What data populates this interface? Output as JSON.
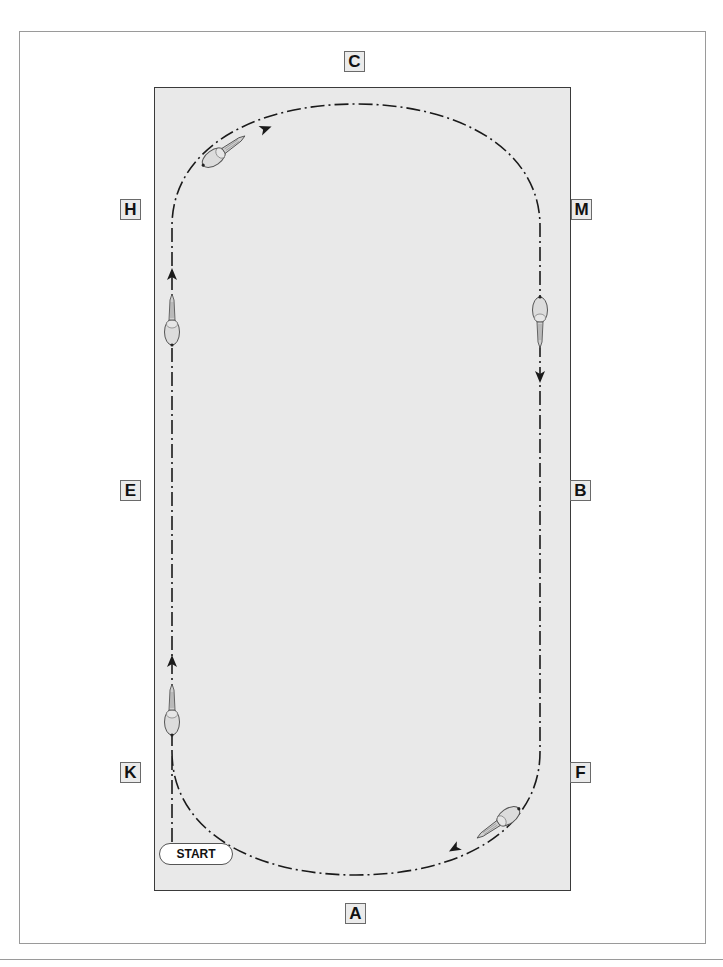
{
  "diagram": {
    "type": "arena-riding-pattern",
    "markers": {
      "C": "C",
      "H": "H",
      "M": "M",
      "E": "E",
      "B": "B",
      "K": "K",
      "F": "F",
      "A": "A"
    },
    "start_label": "START",
    "colors": {
      "arena_fill": "#e9e9e9",
      "arena_border": "#3a3a3a",
      "track_line": "#1a1a1a",
      "marker_fill": "#ebebeb"
    },
    "path": {
      "shape": "oval",
      "line_style": "dash-dot",
      "direction": "clockwise",
      "start_position": "bottom-left near K"
    },
    "riders": [
      {
        "position": "top-left arc near H",
        "heading": "up-right"
      },
      {
        "position": "left side between H and E",
        "heading": "up"
      },
      {
        "position": "right side between M and B",
        "heading": "down"
      },
      {
        "position": "left side near K",
        "heading": "up"
      },
      {
        "position": "bottom-right arc near F",
        "heading": "down-left"
      }
    ]
  }
}
